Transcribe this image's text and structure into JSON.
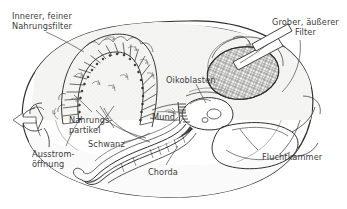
{
  "figure": {
    "language": "de",
    "background_color": "#ffffff",
    "ink_color": "#2e2e2e",
    "text_color": "#3b3b3b",
    "house_tint_color": "#f2f2f0",
    "width": 347,
    "height": 209
  },
  "labels": [
    {
      "id": "inner-filter",
      "line1": "Innerer, feiner",
      "line2": "Nahrungsfilter",
      "x": 12,
      "y": 12,
      "align": "left"
    },
    {
      "id": "coarse-filter",
      "line1": "Grober, äußerer",
      "line2": "Filter",
      "x": 272,
      "y": 18,
      "align": "center"
    },
    {
      "id": "oikoblasts",
      "line1": "Oikoblasten",
      "line2": "",
      "x": 166,
      "y": 76,
      "align": "left"
    },
    {
      "id": "food-particles",
      "line1": "Nahrungs-",
      "line2": "partikel",
      "x": 69,
      "y": 116,
      "align": "left"
    },
    {
      "id": "mouth",
      "line1": "Mund",
      "line2": "",
      "x": 152,
      "y": 113,
      "align": "left"
    },
    {
      "id": "tail",
      "line1": "Schwanz",
      "line2": "",
      "x": 88,
      "y": 140,
      "align": "left"
    },
    {
      "id": "outflow-opening",
      "line1": "Ausstrom-",
      "line2": "öffnung",
      "x": 32,
      "y": 150,
      "align": "left"
    },
    {
      "id": "notochord",
      "line1": "Chorda",
      "line2": "",
      "x": 148,
      "y": 168,
      "align": "left"
    },
    {
      "id": "escape-chamber",
      "line1": "Fluchtkammer",
      "line2": "",
      "x": 262,
      "y": 153,
      "align": "left"
    }
  ],
  "structures": [
    {
      "id": "house-outline",
      "name": "mucous house outer wall"
    },
    {
      "id": "inner-fine-filter",
      "name": "inner fine food filter (horseshoe of ribs)"
    },
    {
      "id": "coarse-outer-filter",
      "name": "coarse outer filter (cross-hatched mesh)"
    },
    {
      "id": "inlet-tubes",
      "name": "two incurrent tubes"
    },
    {
      "id": "animal-body",
      "name": "larvacean trunk with mouth and oikoblasts"
    },
    {
      "id": "tail-chorda",
      "name": "undulating tail containing the notochord"
    },
    {
      "id": "escape-chamber",
      "name": "escape chamber at rear of house"
    },
    {
      "id": "outflow-arrow",
      "name": "exhalant water jet arrow"
    },
    {
      "id": "flow-arrows",
      "name": "internal water current arrows"
    }
  ]
}
